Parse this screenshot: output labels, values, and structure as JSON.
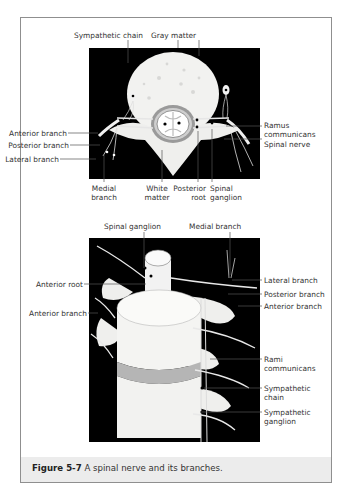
{
  "figure": {
    "number": "Figure 5-7",
    "caption": "A spinal nerve and its branches."
  },
  "top_diagram": {
    "view": "cross-section",
    "labels": {
      "sympathetic_chain": "Sympathetic chain",
      "gray_matter": "Gray matter",
      "ramus_communicans": [
        "Ramus",
        "communicans"
      ],
      "spinal_nerve": "Spinal nerve",
      "anterior_branch": "Anterior branch",
      "posterior_branch": "Posterior branch",
      "lateral_branch": "Lateral branch",
      "medial_branch": [
        "Medial",
        "branch"
      ],
      "white_matter": [
        "White",
        "matter"
      ],
      "posterior_root": [
        "Posterior",
        "root"
      ],
      "spinal_ganglion": [
        "Spinal",
        "ganglion"
      ]
    }
  },
  "bottom_diagram": {
    "view": "oblique vertebral column",
    "labels": {
      "spinal_ganglion": "Spinal ganglion",
      "medial_branch": "Medial branch",
      "anterior_root": "Anterior root",
      "anterior_branch_left": "Anterior branch",
      "lateral_branch": "Lateral branch",
      "posterior_branch": "Posterior branch",
      "anterior_branch_right": "Anterior branch",
      "rami_communicans": [
        "Rami",
        "communicans"
      ],
      "sympathetic_chain": [
        "Sympathetic",
        "chain"
      ],
      "sympathetic_ganglion": [
        "Sympathetic",
        "ganglion"
      ]
    }
  },
  "colors": {
    "frame_border": "#8f8f8f",
    "caption_band": "#ececec",
    "image_background": "#000000",
    "bone": "#f2f2f0",
    "disc": "#b5b5b5"
  }
}
